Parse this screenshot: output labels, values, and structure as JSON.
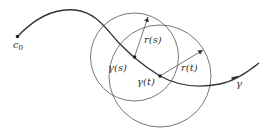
{
  "diagram": {
    "width": 273,
    "height": 130,
    "stroke_color": "#333333",
    "circle_color": "#555555",
    "curve": {
      "name": "gamma",
      "start": [
        17.5,
        36.5
      ],
      "end": [
        259,
        63
      ]
    },
    "labels": {
      "start_point": "c",
      "start_point_sub": "0",
      "gamma_s": "γ(s)",
      "gamma_t": "γ(t)",
      "radius_s": "r(s)",
      "radius_t": "r(t)",
      "curve_label": "γ"
    },
    "points": {
      "gamma_s": {
        "x": 134.5,
        "y": 57
      },
      "gamma_t": {
        "x": 160,
        "y": 76
      }
    },
    "circles": [
      {
        "center": "gamma_s",
        "cx": 134.5,
        "cy": 57,
        "r": 44
      },
      {
        "center": "gamma_t",
        "cx": 160,
        "cy": 76,
        "r": 51
      }
    ]
  }
}
